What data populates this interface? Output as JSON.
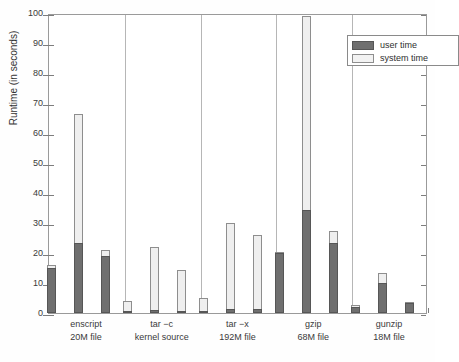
{
  "chart_data": {
    "type": "bar",
    "title": "",
    "xlabel": "",
    "ylabel": "Runtime (in seconds)",
    "ylim": [
      0,
      100
    ],
    "yticks": [
      0,
      10,
      20,
      30,
      40,
      50,
      60,
      70,
      80,
      90,
      100
    ],
    "grid": false,
    "stacked": true,
    "legend": {
      "position": "top-right",
      "entries": [
        {
          "name": "user time",
          "color": "#6f6f6f"
        },
        {
          "name": "system time",
          "color": "#efefef"
        }
      ]
    },
    "groups": [
      {
        "label_line1": "enscript",
        "label_line2": "20M file",
        "bars": [
          {
            "user": 15.0,
            "system": 1.0,
            "total": 16.0
          },
          {
            "user": 23.5,
            "system": 43.0,
            "total": 66.5
          },
          {
            "user": 19.0,
            "system": 2.0,
            "total": 21.0
          }
        ]
      },
      {
        "label_line1": "tar −c",
        "label_line2": "kernel source",
        "bars": [
          {
            "user": 0.3,
            "system": 3.7,
            "total": 4.0
          },
          {
            "user": 1.0,
            "system": 21.0,
            "total": 22.0
          },
          {
            "user": 0.7,
            "system": 13.8,
            "total": 14.5
          }
        ]
      },
      {
        "label_line1": "tar −x",
        "label_line2": "192M file",
        "bars": [
          {
            "user": 0.5,
            "system": 4.5,
            "total": 5.0
          },
          {
            "user": 1.5,
            "system": 28.5,
            "total": 30.0
          },
          {
            "user": 1.5,
            "system": 24.5,
            "total": 26.0
          }
        ]
      },
      {
        "label_line1": "gzip",
        "label_line2": "68M file",
        "bars": [
          {
            "user": 20.0,
            "system": 0.5,
            "total": 20.5
          },
          {
            "user": 34.5,
            "system": 64.5,
            "total": 99.0
          },
          {
            "user": 23.5,
            "system": 4.0,
            "total": 27.5
          }
        ]
      },
      {
        "label_line1": "gunzip",
        "label_line2": "18M file",
        "bars": [
          {
            "user": 2.0,
            "system": 0.8,
            "total": 2.8
          },
          {
            "user": 10.0,
            "system": 3.5,
            "total": 13.5
          },
          {
            "user": 3.3,
            "system": 0.5,
            "total": 3.8
          }
        ]
      }
    ]
  },
  "axis": {
    "y_title": "Runtime (in seconds)",
    "y_tick_labels": [
      "0",
      "10",
      "20",
      "30",
      "40",
      "50",
      "60",
      "70",
      "80",
      "90",
      "100"
    ]
  },
  "legend": {
    "user_label": "user time",
    "system_label": "system time"
  },
  "colors": {
    "user_time": "#6f6f6f",
    "system_time": "#efefef",
    "frame": "#9a9a9a",
    "text": "#3a3a3a"
  }
}
